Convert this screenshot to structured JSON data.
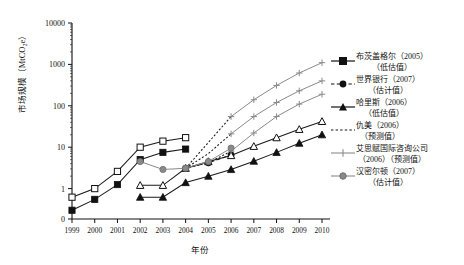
{
  "chart_data": {
    "type": "line",
    "title": "",
    "xlabel": "年份",
    "ylabel": "市场规模（MtCO₂e）",
    "yscale": "log",
    "ylim": [
      0.2,
      10000
    ],
    "ytick_labels": [
      "10000",
      "1000",
      "100",
      "10",
      "1",
      "0"
    ],
    "ytick_values": [
      10000,
      1000,
      100,
      10,
      1,
      0
    ],
    "x": [
      1999,
      2000,
      2001,
      2002,
      2003,
      2004,
      2005,
      2006,
      2007,
      2008,
      2009,
      2010
    ],
    "xtick_labels": [
      "1999",
      "2000",
      "2001",
      "2002",
      "2003",
      "2004",
      "2005",
      "2006",
      "2007",
      "2008",
      "2009",
      "2010"
    ],
    "grid": false,
    "legend_position": "right",
    "series": [
      {
        "id": "butzengeier-low",
        "name": "布茨盖格尔（2005）",
        "sub": "（低估值）",
        "marker": "filled-square",
        "color": "#1a1a1a",
        "dash": "solid",
        "x": [
          1999,
          2000,
          2001,
          2002,
          2003,
          2004
        ],
        "values": [
          0.3,
          0.55,
          1.25,
          5.0,
          7.5,
          9.0
        ]
      },
      {
        "id": "butzengeier-high",
        "name": "布茨盖格尔（2005）高估值",
        "sub": "",
        "marker": "open-square",
        "color": "#1a1a1a",
        "dash": "solid",
        "x": [
          1999,
          2000,
          2001,
          2002,
          2003,
          2004
        ],
        "values": [
          0.62,
          1.0,
          2.6,
          10.0,
          14.0,
          17.0
        ]
      },
      {
        "id": "worldbank-est",
        "name": "世界银行（2007）",
        "sub": "（估计值）",
        "marker": "filled-circle",
        "color": "#1a1a1a",
        "dash": "dashed",
        "x": [
          2004,
          2005,
          2006
        ],
        "values": [
          3.1,
          4.2,
          6.5
        ]
      },
      {
        "id": "harris-low",
        "name": "哈里斯（2006）",
        "sub": "（低估值）",
        "marker": "filled-triangle",
        "color": "#1a1a1a",
        "dash": "solid",
        "x": [
          2002,
          2003,
          2004,
          2005,
          2006,
          2007,
          2008,
          2009,
          2010
        ],
        "values": [
          0.62,
          0.62,
          1.4,
          2.0,
          2.9,
          4.6,
          7.5,
          12.5,
          20.0
        ]
      },
      {
        "id": "harris-high",
        "name": "哈里斯（2006）高估值",
        "sub": "",
        "marker": "open-triangle",
        "color": "#1a1a1a",
        "dash": "solid",
        "x": [
          2002,
          2003,
          2004,
          2005,
          2006,
          2007,
          2008,
          2009,
          2010
        ],
        "values": [
          1.2,
          1.2,
          3.1,
          4.5,
          6.3,
          10.5,
          17.0,
          27.0,
          42.0
        ]
      },
      {
        "id": "qiumei-forecast-a",
        "name": "仇美（2006）",
        "sub": "（预测值）",
        "marker": "none",
        "color": "#1a1a1a",
        "dash": "dotted",
        "x": [
          2004,
          2005,
          2006
        ],
        "values": [
          3.1,
          13.0,
          55.0
        ]
      },
      {
        "id": "qiumei-forecast-b",
        "name": "仇美（2006）下界",
        "sub": "",
        "marker": "none",
        "color": "#1a1a1a",
        "dash": "dotted",
        "x": [
          2004,
          2005,
          2006
        ],
        "values": [
          3.1,
          7.0,
          21.0
        ]
      },
      {
        "id": "qiumei-forecast-c",
        "name": "仇美（2006）最低",
        "sub": "",
        "marker": "none",
        "color": "#1a1a1a",
        "dash": "dotted",
        "x": [
          2004,
          2005,
          2006
        ],
        "values": [
          3.1,
          4.2,
          8.0
        ]
      },
      {
        "id": "icf-high",
        "name": "艾思赋国际咨询公司（2006）高",
        "sub": "",
        "marker": "plus",
        "color": "#8a8a8a",
        "dash": "solid",
        "x": [
          2006,
          2007,
          2008,
          2009,
          2010
        ],
        "values": [
          55.0,
          140.0,
          310.0,
          620.0,
          1100.0
        ]
      },
      {
        "id": "icf-mid",
        "name": "艾思赋国际咨询公司（2006）",
        "sub": "（2006）（预测值）",
        "marker": "plus",
        "color": "#8a8a8a",
        "dash": "solid",
        "x": [
          2006,
          2007,
          2008,
          2009,
          2010
        ],
        "values": [
          21.0,
          55.0,
          120.0,
          230.0,
          400.0
        ]
      },
      {
        "id": "icf-low",
        "name": "艾思赋国际咨询公司（2006）低",
        "sub": "",
        "marker": "plus",
        "color": "#8a8a8a",
        "dash": "solid",
        "x": [
          2006,
          2007,
          2008,
          2009,
          2010
        ],
        "values": [
          8.0,
          22.0,
          55.0,
          110.0,
          190.0
        ]
      },
      {
        "id": "hamilton-est",
        "name": "汉密尔顿（2007）",
        "sub": "（估计值）",
        "marker": "gray-circle",
        "color": "#8a8a8a",
        "dash": "solid",
        "x": [
          2002,
          2003,
          2004,
          2005,
          2006
        ],
        "values": [
          4.5,
          2.9,
          3.1,
          4.5,
          9.5
        ]
      }
    ]
  },
  "legend": {
    "items": [
      {
        "label": "布茨盖格尔（2005）",
        "sub": "（低估值）",
        "key": "filled-square-solid"
      },
      {
        "label": "世界银行（2007）",
        "sub": "（估计值）",
        "key": "filled-circle-dashed"
      },
      {
        "label": "哈里斯（2006）",
        "sub": "（低估值）",
        "key": "filled-triangle-solid"
      },
      {
        "label": "仇美（2006）",
        "sub": "（预测值）",
        "key": "dotted-line"
      },
      {
        "label": "艾思赋国际咨询公司",
        "sub": "（2006）（预测值）",
        "key": "gray-plus-solid"
      },
      {
        "label": "汉密尔顿（2007）",
        "sub": "（估计值）",
        "key": "gray-circle-solid"
      }
    ]
  }
}
